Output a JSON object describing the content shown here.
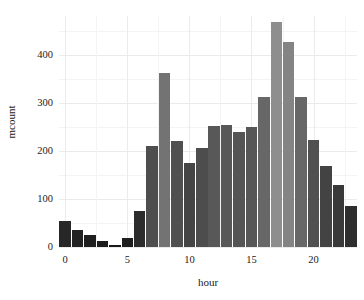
{
  "chart_data": {
    "type": "bar",
    "title": "",
    "subtitle": "",
    "xlabel": "hour",
    "ylabel": "mcount",
    "categories": [
      0,
      1,
      2,
      3,
      4,
      5,
      6,
      7,
      8,
      9,
      10,
      11,
      12,
      13,
      14,
      15,
      16,
      17,
      18,
      19,
      20,
      21,
      22,
      23
    ],
    "values": [
      55,
      35,
      24,
      13,
      5,
      19,
      75,
      211,
      362,
      220,
      175,
      207,
      253,
      254,
      240,
      250,
      313,
      468,
      427,
      312,
      223,
      168,
      129,
      86
    ],
    "xlim": [
      -0.5,
      23.5
    ],
    "ylim": [
      0,
      481
    ],
    "x_ticks": [
      0,
      5,
      10,
      15,
      20
    ],
    "y_ticks": [
      0,
      100,
      200,
      300,
      400
    ],
    "y_minor_ticks": [
      50,
      150,
      250,
      350,
      450
    ],
    "x_minor_ticks": [
      2.5,
      7.5,
      12.5,
      17.5,
      22.5
    ],
    "grid": true,
    "legend": "none",
    "bar_fill_mode": "gradient-by-height",
    "bar_color_low": "#1a1a1a",
    "bar_color_high": "#8e8e8e",
    "grid_color_major": "#ebebeb",
    "grid_color_minor": "#f4f4f4",
    "panel_background": "#ffffff",
    "text_color": "#1a1a1a"
  }
}
